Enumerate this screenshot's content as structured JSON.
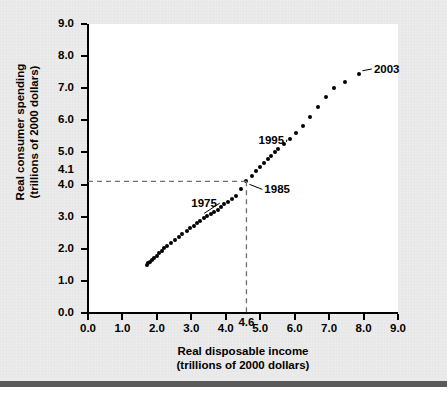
{
  "chart_data": {
    "type": "scatter",
    "title": "",
    "xlabel": "Real disposable income",
    "xlabel_sub": "(trillions of 2000 dollars)",
    "ylabel": "Real consumer spending",
    "ylabel_sub": "(trillions of 2000 dollars)",
    "xlim": [
      0.0,
      9.0
    ],
    "ylim": [
      0.0,
      9.0
    ],
    "grid": false,
    "legend": null,
    "xticks": [
      "0.0",
      "1.0",
      "2.0",
      "3.0",
      "4.0",
      "5.0",
      "6.0",
      "7.0",
      "8.0",
      "9.0"
    ],
    "yticks": [
      "0.0",
      "1.0",
      "2.0",
      "3.0",
      "4.0",
      "5.0",
      "6.0",
      "7.0",
      "8.0",
      "9.0"
    ],
    "special_xtick": "4.6",
    "special_ytick": "4.1",
    "guide_lines": {
      "x": 4.6,
      "y": 4.1,
      "style": "dashed",
      "color": "#6f6f6f"
    },
    "x": [
      1.7,
      1.75,
      1.8,
      1.86,
      1.92,
      1.99,
      2.06,
      2.14,
      2.22,
      2.3,
      2.4,
      2.52,
      2.63,
      2.74,
      2.86,
      2.97,
      3.08,
      3.17,
      3.26,
      3.36,
      3.46,
      3.56,
      3.67,
      3.76,
      3.86,
      3.96,
      4.06,
      4.18,
      4.3,
      4.45,
      4.6,
      4.76,
      4.88,
      5.0,
      5.12,
      5.22,
      5.32,
      5.42,
      5.52,
      5.68,
      5.85,
      6.05,
      6.25,
      6.45,
      6.68,
      6.9,
      7.15,
      7.45,
      7.88
    ],
    "y": [
      1.5,
      1.55,
      1.6,
      1.66,
      1.72,
      1.79,
      1.86,
      1.94,
      2.02,
      2.1,
      2.18,
      2.28,
      2.38,
      2.47,
      2.55,
      2.64,
      2.72,
      2.8,
      2.88,
      2.95,
      3.01,
      3.08,
      3.15,
      3.22,
      3.3,
      3.38,
      3.46,
      3.55,
      3.65,
      3.85,
      4.1,
      4.28,
      4.42,
      4.55,
      4.68,
      4.8,
      4.9,
      5.0,
      5.1,
      5.25,
      5.42,
      5.6,
      5.82,
      6.1,
      6.42,
      6.72,
      7.0,
      7.18,
      7.45
    ],
    "annotations": [
      {
        "label": "1975",
        "point_index": 20,
        "text_x": 3.0,
        "text_y": 3.42
      },
      {
        "label": "1985",
        "point_index": 30,
        "text_x": 5.12,
        "text_y": 3.85
      },
      {
        "label": "1995",
        "point_index": 40,
        "text_x": 4.95,
        "text_y": 5.4
      },
      {
        "label": "2003",
        "point_index": 48,
        "text_x": 8.3,
        "text_y": 7.6
      }
    ]
  },
  "colors": {
    "background": "#ebebeb",
    "plot_background": "#ffffff",
    "axis": "#000000",
    "marker": "#000000",
    "guide": "#6f6f6f",
    "bottom_rule": "#5a5a5a"
  }
}
